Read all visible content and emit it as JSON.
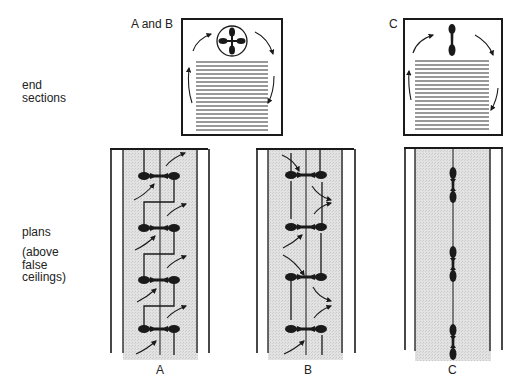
{
  "row_labels": {
    "end_sections": [
      "end",
      "sections"
    ],
    "plans": "plans",
    "plans_note": [
      "(above",
      "false",
      "ceilings)"
    ]
  },
  "section_labels": {
    "ab": "A and B",
    "c": "C"
  },
  "plan_labels": [
    "A",
    "B",
    "C"
  ],
  "colors": {
    "line": "#1a1a1a",
    "shade": "#dcdcdc",
    "background": "#ffffff"
  }
}
